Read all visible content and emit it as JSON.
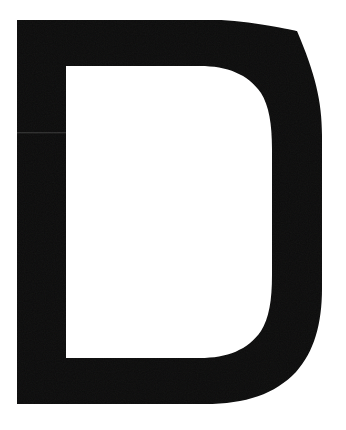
{
  "artwork": {
    "kind": "letterform",
    "character": "D",
    "description": "Uppercase letter D",
    "style": "heavy bold sans-serif, solid fill, scanned print",
    "ink_color": "#0b0b0b",
    "background_color": "#ffffff",
    "canvas": {
      "width": 346,
      "height": 430
    },
    "geometry": {
      "outer_left": 17,
      "outer_right": 322,
      "outer_top": 20,
      "outer_bottom": 404,
      "stem_width": 49,
      "top_bar_height": 46,
      "bottom_bar_height": 46,
      "counter_left": 66,
      "counter_right": 272,
      "counter_top": 66,
      "counter_bottom": 358,
      "straight_run_top_end_x": 215,
      "straight_run_bottom_end_x": 205
    },
    "artifacts": {
      "scan_seam_y": 133,
      "grain": "subtle"
    }
  }
}
